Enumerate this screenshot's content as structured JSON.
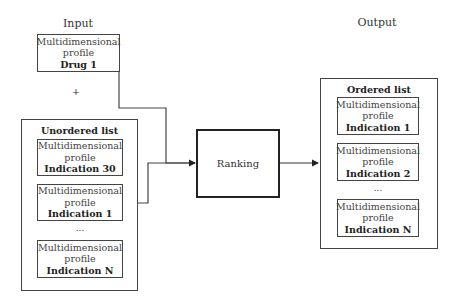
{
  "labels": {
    "input": "Input",
    "output": "Output",
    "plus": "+"
  },
  "drug_box": {
    "line1": "Multidimensional",
    "line2": "profile",
    "name": "Drug 1"
  },
  "unordered_list": {
    "title": "Unordered list",
    "items": [
      {
        "line1": "Multidimensional",
        "line2": "profile",
        "name": "Indication 30"
      },
      {
        "line1": "Multidimensional",
        "line2": "profile",
        "name": "Indication 1"
      },
      {
        "line1": "Multidimensional",
        "line2": "profile",
        "name": "Indication N"
      }
    ],
    "ellipsis": "..."
  },
  "ranking": {
    "label": "Ranking"
  },
  "ordered_list": {
    "title": "Ordered list",
    "items": [
      {
        "line1": "Multidimensional",
        "line2": "profile",
        "name": "Indication 1"
      },
      {
        "line1": "Multidimensional",
        "line2": "profile",
        "name": "Indication 2"
      },
      {
        "line1": "Multidimensional",
        "line2": "profile",
        "name": "Indication N"
      }
    ],
    "ellipsis": "..."
  }
}
